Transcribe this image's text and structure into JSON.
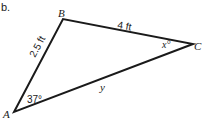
{
  "problem_label": "b.",
  "triangle": {
    "vertices": [
      {
        "id": "A",
        "label": "A"
      },
      {
        "id": "B",
        "label": "B"
      },
      {
        "id": "C",
        "label": "C"
      }
    ],
    "sides": {
      "AB": "2.5 ft",
      "BC": "4 ft",
      "AC": "y"
    },
    "angles": {
      "A": "37°",
      "C": "x°"
    }
  }
}
